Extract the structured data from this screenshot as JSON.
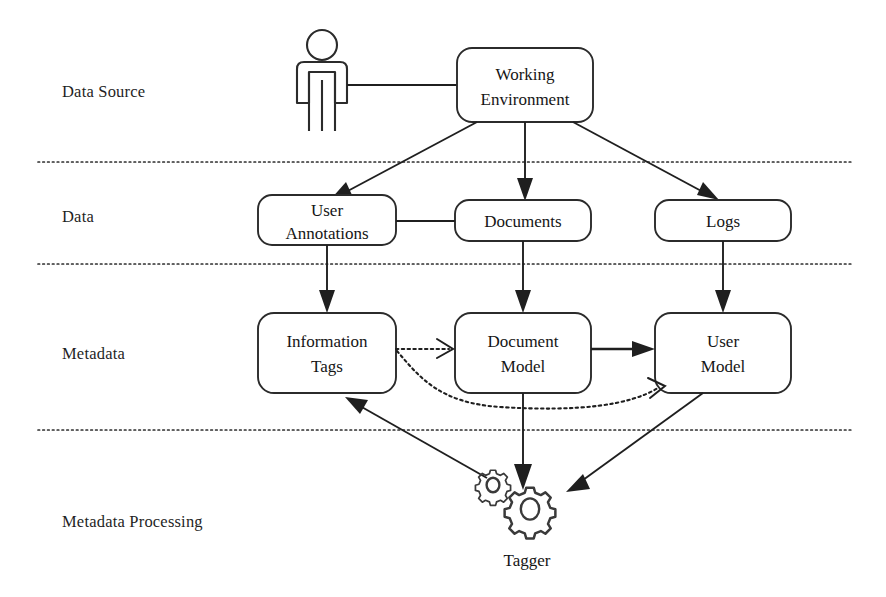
{
  "diagram": {
    "layers": [
      {
        "id": "data-source",
        "label": "Data Source"
      },
      {
        "id": "data",
        "label": "Data"
      },
      {
        "id": "metadata",
        "label": "Metadata"
      },
      {
        "id": "metadata-processing",
        "label": "Metadata Processing"
      }
    ],
    "nodes": {
      "actor": {
        "label": "",
        "icon": "user-actor-icon"
      },
      "working_environment": {
        "label_line1": "Working",
        "label_line2": "Environment"
      },
      "user_annotations": {
        "label_line1": "User",
        "label_line2": "Annotations"
      },
      "documents": {
        "label_line1": "Documents",
        "label_line2": ""
      },
      "logs": {
        "label_line1": "Logs",
        "label_line2": ""
      },
      "information_tags": {
        "label_line1": "Information",
        "label_line2": "Tags"
      },
      "document_model": {
        "label_line1": "Document",
        "label_line2": "Model"
      },
      "user_model": {
        "label_line1": "User",
        "label_line2": "Model"
      },
      "tagger": {
        "label": "Tagger",
        "icon": "gears-icon"
      }
    },
    "edges": [
      {
        "id": "actor-to-working-environment",
        "from": "actor",
        "to": "working_environment",
        "style": "solid",
        "arrow": "none"
      },
      {
        "id": "working-environment-to-user-annotations",
        "from": "working_environment",
        "to": "user_annotations",
        "style": "solid",
        "arrow": "filled"
      },
      {
        "id": "working-environment-to-documents",
        "from": "working_environment",
        "to": "documents",
        "style": "solid",
        "arrow": "filled"
      },
      {
        "id": "working-environment-to-logs",
        "from": "working_environment",
        "to": "logs",
        "style": "solid",
        "arrow": "filled"
      },
      {
        "id": "user-annotations-to-documents",
        "from": "user_annotations",
        "to": "documents",
        "style": "solid",
        "arrow": "none"
      },
      {
        "id": "user-annotations-to-information-tags",
        "from": "user_annotations",
        "to": "information_tags",
        "style": "solid",
        "arrow": "filled"
      },
      {
        "id": "documents-to-document-model",
        "from": "documents",
        "to": "document_model",
        "style": "solid",
        "arrow": "filled"
      },
      {
        "id": "logs-to-user-model",
        "from": "logs",
        "to": "user_model",
        "style": "solid",
        "arrow": "filled"
      },
      {
        "id": "information-tags-to-document-model",
        "from": "information_tags",
        "to": "document_model",
        "style": "dotted",
        "arrow": "open"
      },
      {
        "id": "information-tags-to-user-model",
        "from": "information_tags",
        "to": "user_model",
        "style": "dotted-curve",
        "arrow": "open"
      },
      {
        "id": "document-model-to-user-model",
        "from": "document_model",
        "to": "user_model",
        "style": "solid",
        "arrow": "filled"
      },
      {
        "id": "document-model-to-tagger",
        "from": "document_model",
        "to": "tagger",
        "style": "solid",
        "arrow": "filled"
      },
      {
        "id": "tagger-to-information-tags",
        "from": "tagger",
        "to": "information_tags",
        "style": "solid",
        "arrow": "filled"
      },
      {
        "id": "user-model-to-tagger",
        "from": "user_model",
        "to": "tagger",
        "style": "solid",
        "arrow": "filled"
      }
    ],
    "colors": {
      "background": "#ffffff",
      "stroke": "#1f1f1f",
      "box_stroke": "#2b2b2b",
      "divider": "#2e2e2e",
      "text": "#151515"
    }
  }
}
